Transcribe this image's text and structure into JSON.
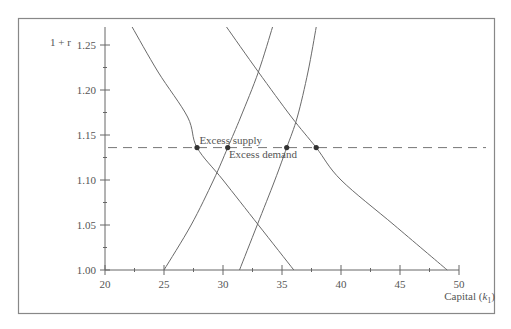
{
  "chart_data": {
    "type": "line",
    "title": "",
    "xlabel": "Capital (k1)",
    "xlabel_main": "Capital (",
    "xlabel_var": "k",
    "xlabel_sub": "1",
    "xlabel_close": ")",
    "ylabel": "1 + r",
    "xlim": [
      20,
      50
    ],
    "ylim": [
      1.0,
      1.27
    ],
    "xticks": [
      20,
      25,
      30,
      35,
      40,
      45,
      50
    ],
    "xtick_labels": [
      "20",
      "25",
      "30",
      "35",
      "40",
      "45",
      "50"
    ],
    "xminor": [
      22.5,
      27.5,
      32.5,
      37.5,
      42.5,
      47.5
    ],
    "yticks": [
      1.0,
      1.05,
      1.1,
      1.15,
      1.2,
      1.25
    ],
    "ytick_labels": [
      "1.00",
      "1.05",
      "1.10",
      "1.15",
      "1.20",
      "1.25"
    ],
    "yminor": [
      1.025,
      1.075,
      1.125,
      1.175,
      1.225
    ],
    "grid": false,
    "legend": null,
    "series": [
      {
        "name": "curve-a-decreasing-left",
        "points": [
          [
            22.3,
            1.27
          ],
          [
            24.5,
            1.22
          ],
          [
            27.0,
            1.17
          ],
          [
            27.8,
            1.136
          ],
          [
            30.0,
            1.1
          ],
          [
            33.0,
            1.05
          ],
          [
            36.0,
            1.0
          ]
        ]
      },
      {
        "name": "curve-b-increasing-left",
        "points": [
          [
            25.0,
            1.0
          ],
          [
            27.3,
            1.05
          ],
          [
            29.2,
            1.1
          ],
          [
            30.4,
            1.136
          ],
          [
            31.5,
            1.17
          ],
          [
            33.0,
            1.22
          ],
          [
            34.2,
            1.27
          ]
        ]
      },
      {
        "name": "curve-c-increasing-right",
        "points": [
          [
            31.4,
            1.0
          ],
          [
            32.9,
            1.05
          ],
          [
            34.4,
            1.1
          ],
          [
            35.4,
            1.136
          ],
          [
            36.3,
            1.17
          ],
          [
            37.2,
            1.22
          ],
          [
            37.9,
            1.27
          ]
        ]
      },
      {
        "name": "curve-d-decreasing-right",
        "points": [
          [
            30.3,
            1.27
          ],
          [
            33.0,
            1.22
          ],
          [
            35.8,
            1.17
          ],
          [
            37.9,
            1.136
          ],
          [
            40.0,
            1.1
          ],
          [
            44.5,
            1.05
          ],
          [
            49.0,
            1.0
          ]
        ]
      }
    ],
    "reference_line": {
      "y": 1.136,
      "style": "dashed"
    },
    "intersection_points": [
      [
        27.8,
        1.136
      ],
      [
        30.4,
        1.136
      ],
      [
        35.4,
        1.136
      ],
      [
        37.9,
        1.136
      ]
    ],
    "annotations": [
      {
        "text": "Excess supply",
        "x": 28.0,
        "y": 1.14
      },
      {
        "text": "Excess demand",
        "x": 30.5,
        "y": 1.124
      }
    ]
  },
  "colors": {
    "axis": "#666666",
    "curve": "#6a6a6a",
    "dash": "#777777",
    "point": "#333333",
    "frame": "#888888",
    "text": "#555555"
  }
}
